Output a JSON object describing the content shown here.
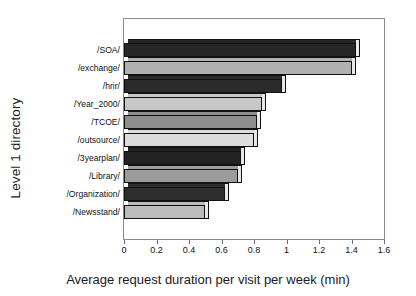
{
  "chart_data": {
    "type": "bar",
    "orientation": "horizontal",
    "title": "",
    "xlabel": "Average request duration per visit per week (min)",
    "ylabel": "Level 1 directory",
    "categories": [
      "/SOA/",
      "/exchange/",
      "/hrir/",
      "/Year_2000/",
      "/TCOE/",
      "/outsource/",
      "/3yearplan/",
      "/Library/",
      "/Organization/",
      "/Newsstand/"
    ],
    "values": [
      1.43,
      1.4,
      0.97,
      0.85,
      0.82,
      0.8,
      0.72,
      0.7,
      0.62,
      0.5
    ],
    "bar_colors": [
      "#262626",
      "#b0b0b0",
      "#2b2b2b",
      "#c8c8c8",
      "#8e8e8e",
      "#dcdcdc",
      "#232323",
      "#9c9c9c",
      "#2e2e2e",
      "#bcbcbc"
    ],
    "xlim": [
      0,
      1.6
    ],
    "xticks": [
      0,
      0.2,
      0.4,
      0.6,
      0.8,
      1,
      1.2,
      1.4,
      1.6
    ],
    "xticklabels": [
      "0",
      "0.2",
      "0.4",
      "0.6",
      "0.8",
      "1",
      "1.2",
      "1.4",
      "1.6"
    ],
    "grid": false,
    "legend": false
  }
}
